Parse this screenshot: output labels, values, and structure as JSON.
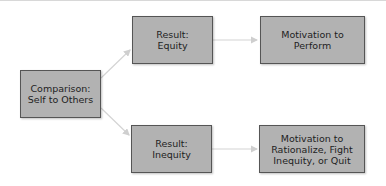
{
  "diagram": {
    "type": "flowchart",
    "nodes": [
      {
        "id": "comparison",
        "lines": [
          "Comparison:",
          "Self to Others"
        ]
      },
      {
        "id": "equity",
        "lines": [
          "Result:",
          "Equity"
        ]
      },
      {
        "id": "perform",
        "lines": [
          "Motivation to",
          "Perform"
        ]
      },
      {
        "id": "inequity",
        "lines": [
          "Result:",
          "Inequity"
        ]
      },
      {
        "id": "rationalize",
        "lines": [
          "Motivation to",
          "Rationalize, Fight",
          "Inequity, or Quit"
        ]
      }
    ],
    "edges": [
      {
        "from": "comparison",
        "to": "equity"
      },
      {
        "from": "comparison",
        "to": "inequity"
      },
      {
        "from": "equity",
        "to": "perform"
      },
      {
        "from": "inequity",
        "to": "rationalize"
      }
    ],
    "colors": {
      "box_fill": "#b2b2b2",
      "box_border": "#555555",
      "arrow": "#d0d0d0"
    }
  }
}
